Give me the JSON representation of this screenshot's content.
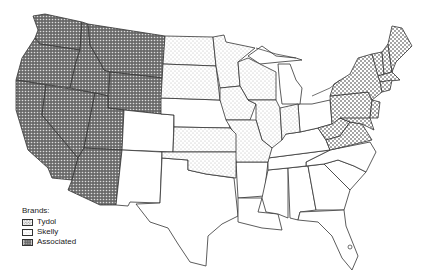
{
  "map": {
    "title": "",
    "subject": "Gasoline brand territories, United States",
    "legend": {
      "title": "Brands:",
      "items": [
        {
          "key": "tydol",
          "label": "Tydol",
          "pattern": "coarse-dots",
          "color": "#7a7a7a"
        },
        {
          "key": "skelly",
          "label": "Skelly",
          "pattern": "fine-dots",
          "color": "#bdbdbd"
        },
        {
          "key": "associated",
          "label": "Associated",
          "pattern": "dense-dots-dark",
          "color": "#555555"
        }
      ]
    },
    "regions": {
      "associated": [
        "Washington",
        "Oregon",
        "California",
        "Nevada",
        "Idaho",
        "Utah",
        "Arizona",
        "Montana",
        "Wyoming"
      ],
      "skelly": [
        "North Dakota",
        "South Dakota",
        "Minnesota",
        "Iowa",
        "Wisconsin",
        "Kansas",
        "Oklahoma",
        "Missouri",
        "Illinois",
        "Indiana"
      ],
      "tydol": [
        "New York",
        "Pennsylvania",
        "Maine",
        "New Hampshire",
        "Vermont",
        "Massachusetts",
        "Connecticut",
        "Rhode Island",
        "New Jersey",
        "Delaware",
        "Maryland",
        "West Virginia",
        "Virginia"
      ],
      "none": [
        "Colorado",
        "New Mexico",
        "Nebraska",
        "Texas",
        "Michigan",
        "Ohio",
        "Kentucky",
        "Tennessee",
        "Arkansas",
        "Louisiana",
        "Mississippi",
        "Alabama",
        "Georgia",
        "Florida",
        "South Carolina",
        "North Carolina"
      ]
    }
  }
}
